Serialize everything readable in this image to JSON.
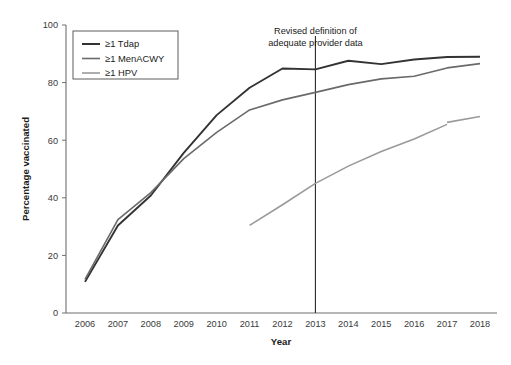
{
  "chart_data": {
    "type": "line",
    "title": "",
    "xlabel": "Year",
    "ylabel": "Percentage vaccinated",
    "categories": [
      "2006",
      "2007",
      "2008",
      "2009",
      "2010",
      "2011",
      "2012",
      "2013",
      "2014",
      "2015",
      "2016",
      "2017",
      "2018"
    ],
    "x": [
      2006,
      2007,
      2008,
      2009,
      2010,
      2011,
      2012,
      2013,
      2014,
      2015,
      2016,
      2017,
      2018
    ],
    "xlim": [
      2006,
      2018
    ],
    "ylim": [
      0,
      100
    ],
    "yticks": [
      0,
      20,
      40,
      60,
      80,
      100
    ],
    "ytick_labels": [
      "0",
      "20",
      "40",
      "60",
      "80",
      "100"
    ],
    "xtick_labels": [
      "2006",
      "2007",
      "2008",
      "2009",
      "2010",
      "2011",
      "2012",
      "2013",
      "2014",
      "2015",
      "2016",
      "2017",
      "2018"
    ],
    "grid": false,
    "legend_position": "upper left",
    "series": [
      {
        "name": "≥1 Tdap",
        "color": "#333333",
        "width": 1.9,
        "values": [
          10.8,
          30.4,
          40.8,
          55.6,
          68.7,
          78.2,
          84.9,
          84.6,
          87.6,
          86.4,
          88.0,
          88.9,
          89.0
        ]
      },
      {
        "name": "≥1 MenACWY",
        "color": "#6a6a6a",
        "width": 1.6,
        "values": [
          11.7,
          32.4,
          41.8,
          53.6,
          62.7,
          70.5,
          74.0,
          76.6,
          79.3,
          81.3,
          82.2,
          85.1,
          86.6
        ]
      },
      {
        "name": "≥1 HPV",
        "color": "#9a9a9a",
        "width": 1.6,
        "values": [
          null,
          null,
          null,
          null,
          null,
          30.4,
          37.6,
          45.0,
          51.0,
          56.1,
          60.4,
          65.5,
          68.2
        ],
        "segments": [
          {
            "x": [
              2011,
              2012,
              2013,
              2014,
              2015,
              2016,
              2017
            ],
            "y": [
              30.4,
              37.6,
              45.0,
              51.0,
              56.1,
              60.4,
              65.5
            ]
          },
          {
            "x": [
              2017,
              2018
            ],
            "y": [
              66.2,
              68.2
            ]
          }
        ]
      }
    ],
    "annotations": [
      {
        "name": "revised-definition-note",
        "lines": [
          "Revised definition of",
          "adequate provider data"
        ],
        "x": 2013,
        "vertical_line": true
      }
    ]
  },
  "legend": {
    "items": [
      {
        "label": "≥1 Tdap",
        "color": "#333333"
      },
      {
        "label": "≥1 MenACWY",
        "color": "#6a6a6a"
      },
      {
        "label": "≥1 HPV",
        "color": "#9a9a9a"
      }
    ]
  },
  "annotation": {
    "line1": "Revised definition of",
    "line2": "adequate provider data"
  },
  "axes": {
    "y_title": "Percentage vaccinated",
    "x_title": "Year"
  }
}
